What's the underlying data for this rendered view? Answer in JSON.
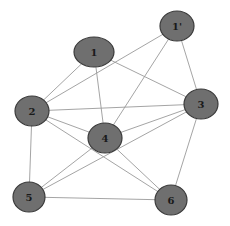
{
  "diagram": {
    "type": "undirected-graph",
    "nodes": [
      {
        "id": "1",
        "label": "1",
        "cx": 94,
        "cy": 52,
        "rx": 20,
        "ry": 15
      },
      {
        "id": "1p",
        "label": "1'",
        "cx": 177,
        "cy": 26,
        "rx": 17,
        "ry": 15
      },
      {
        "id": "2",
        "label": "2",
        "cx": 32,
        "cy": 111,
        "rx": 17,
        "ry": 15
      },
      {
        "id": "3",
        "label": "3",
        "cx": 201,
        "cy": 104,
        "rx": 17,
        "ry": 15
      },
      {
        "id": "4",
        "label": "4",
        "cx": 105,
        "cy": 138,
        "rx": 17,
        "ry": 15
      },
      {
        "id": "5",
        "label": "5",
        "cx": 29,
        "cy": 197,
        "rx": 16,
        "ry": 15
      },
      {
        "id": "6",
        "label": "6",
        "cx": 171,
        "cy": 200,
        "rx": 16,
        "ry": 15
      }
    ],
    "edges": [
      [
        "1",
        "2"
      ],
      [
        "1",
        "4"
      ],
      [
        "1",
        "3"
      ],
      [
        "1p",
        "2"
      ],
      [
        "1p",
        "4"
      ],
      [
        "1p",
        "3"
      ],
      [
        "2",
        "3"
      ],
      [
        "2",
        "4"
      ],
      [
        "2",
        "5"
      ],
      [
        "2",
        "6"
      ],
      [
        "3",
        "4"
      ],
      [
        "3",
        "5"
      ],
      [
        "3",
        "6"
      ],
      [
        "4",
        "5"
      ],
      [
        "4",
        "6"
      ],
      [
        "5",
        "6"
      ]
    ],
    "colors": {
      "node_fill": "#6f6f6f",
      "node_stroke": "#3a3a3a",
      "edge": "#9a9a9a",
      "label": "#1a1a1a",
      "background": "#ffffff"
    }
  }
}
